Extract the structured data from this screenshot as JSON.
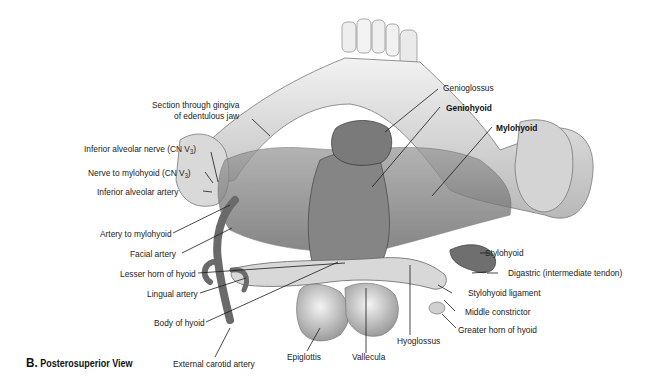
{
  "figure": {
    "panel_letter": "B.",
    "panel_title": "Posterosuperior View",
    "style": "grayscale anatomical illustration"
  },
  "labels": {
    "genioglossus": "Genioglossus",
    "geniohyoid": "Geniohyoid",
    "mylohyoid": "Mylohyoid",
    "section_gingiva_line1": "Section through gingiva",
    "section_gingiva_line2": "of edentulous jaw",
    "inferior_alveolar_nerve": "Inferior alveolar nerve (CN V",
    "inferior_alveolar_nerve_sub": "3",
    "nerve_to_mylohyoid": "Nerve to mylohyoid (CN V",
    "nerve_to_mylohyoid_sub": "3",
    "inferior_alveolar_artery": "Inferior alveolar artery",
    "artery_to_mylohyoid": "Artery to mylohyoid",
    "facial_artery": "Facial artery",
    "lesser_horn_hyoid": "Lesser horn of hyoid",
    "lingual_artery": "Lingual artery",
    "body_of_hyoid": "Body of hyoid",
    "external_carotid_artery": "External carotid artery",
    "epiglottis": "Epiglottis",
    "vallecula": "Vallecula",
    "hyoglossus": "Hyoglossus",
    "stylohyoid": "Stylohyoid",
    "digastric": "Digastric (intermediate tendon)",
    "stylohyoid_ligament": "Stylohyoid ligament",
    "middle_constrictor": "Middle constrictor",
    "greater_horn_hyoid": "Greater horn of hyoid"
  },
  "bold_labels": [
    "Geniohyoid",
    "Mylohyoid"
  ],
  "colors": {
    "background": "#ffffff",
    "text": "#222222",
    "leader_line": "#1a1a1a",
    "bone_light": "#e6e6e6",
    "bone_mid": "#bdbdbd",
    "muscle_dark": "#6e6e6e",
    "muscle_mid": "#8f8f8f"
  }
}
